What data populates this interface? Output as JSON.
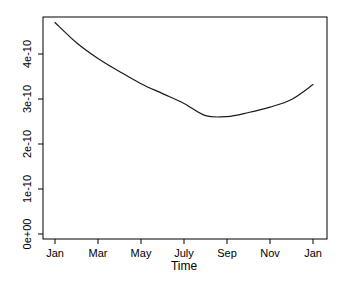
{
  "figure": {
    "background": "#ffffff",
    "axis_color": "#000000",
    "line_color": "#1a1a1a"
  },
  "chart_data": {
    "type": "line",
    "title": "",
    "xlabel": "Time",
    "ylabel": "",
    "x_categories": [
      "Jan",
      "Feb",
      "Mar",
      "Apr",
      "May",
      "Jun",
      "Jul",
      "Aug",
      "Sep",
      "Oct",
      "Nov",
      "Dec",
      "Jan"
    ],
    "series": [
      {
        "name": "value",
        "unit_scale": "1e-10",
        "values_e10": [
          4.7,
          4.25,
          3.9,
          3.61,
          3.34,
          3.12,
          2.9,
          2.63,
          2.61,
          2.7,
          2.82,
          2.99,
          3.32
        ]
      }
    ],
    "x_tick_labels": [
      "Jan",
      "Mar",
      "May",
      "July",
      "Sep",
      "Nov",
      "Jan"
    ],
    "x_tick_month_indices": [
      0,
      2,
      4,
      6,
      8,
      10,
      12
    ],
    "y_tick_labels": [
      "0e+00",
      "1e-10",
      "2e-10",
      "3e-10",
      "4e-10"
    ],
    "y_tick_values_e10": [
      0,
      1,
      2,
      3,
      4
    ],
    "ylim_e10": [
      0,
      4.93
    ],
    "grid": false,
    "legend": null,
    "y_labels_rotated": true
  }
}
